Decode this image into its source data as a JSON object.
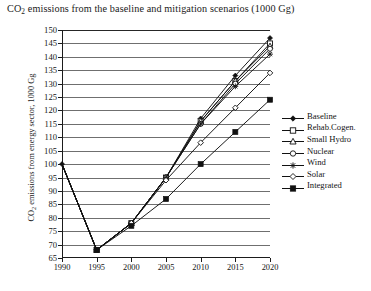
{
  "chart_data": {
    "type": "line",
    "title": "CO2 emissions from the baseline and mitigation scenarios (1000 Gg)",
    "title_prefix": "CO",
    "title_sub": "2",
    "title_rest": " emissions from the baseline and mitigation scenarios (1000 Gg)",
    "xlabel": "",
    "ylabel": "CO2 emissions from energy sector, 1000 Gg",
    "ylabel_prefix": "CO",
    "ylabel_sub": "2",
    "ylabel_rest": " emissions from energy sector, 1000 Gg",
    "x": [
      1990,
      1995,
      2000,
      2005,
      2010,
      2015,
      2020
    ],
    "categories": [
      "1990",
      "1995",
      "2000",
      "2005",
      "2010",
      "2015",
      "2020"
    ],
    "xlim": [
      1990,
      2020
    ],
    "ylim": [
      65,
      150
    ],
    "ytick_values": [
      65,
      70,
      75,
      80,
      85,
      90,
      95,
      100,
      105,
      110,
      115,
      120,
      125,
      130,
      135,
      140,
      145,
      150
    ],
    "ytick_labels": [
      "65",
      "70",
      "75",
      "80",
      "85",
      "90",
      "95",
      "100",
      "105",
      "110",
      "115",
      "120",
      "125",
      "130",
      "135",
      "140",
      "145",
      "150"
    ],
    "grid": true,
    "grid_axis": "y",
    "legend_position": "right",
    "series": [
      {
        "name": "Baseline",
        "marker": "filled-diamond",
        "values": [
          100,
          68,
          78,
          95,
          117,
          133,
          147
        ]
      },
      {
        "name": "Rehab.Cogen.",
        "marker": "open-square",
        "values": [
          100,
          68,
          78,
          95,
          116,
          131,
          145
        ]
      },
      {
        "name": "Small Hydro",
        "marker": "open-triangle",
        "values": [
          100,
          68,
          78,
          95,
          116,
          131,
          144
        ]
      },
      {
        "name": "Nuclear",
        "marker": "open-circle",
        "values": [
          100,
          68,
          78,
          95,
          115,
          130,
          143
        ]
      },
      {
        "name": "Wind",
        "marker": "asterisk",
        "values": [
          100,
          68,
          78,
          95,
          115,
          129,
          141
        ]
      },
      {
        "name": "Solar",
        "marker": "open-diamond",
        "values": [
          100,
          68,
          78,
          94,
          108,
          121,
          134
        ]
      },
      {
        "name": "Integrated",
        "marker": "filled-square",
        "values": [
          100,
          68,
          77,
          87,
          100,
          112,
          124
        ]
      }
    ]
  },
  "legend": {
    "entries": [
      {
        "label": "Baseline"
      },
      {
        "label": "Rehab.Cogen."
      },
      {
        "label": "Small Hydro"
      },
      {
        "label": "Nuclear"
      },
      {
        "label": "Wind"
      },
      {
        "label": "Solar"
      },
      {
        "label": "Integrated"
      }
    ]
  },
  "style": {
    "line_color": "#111111",
    "grid_color": "#6f6f6f",
    "axis_color": "#1b1b1b",
    "text_color": "#151515",
    "background": "#ffffff"
  }
}
